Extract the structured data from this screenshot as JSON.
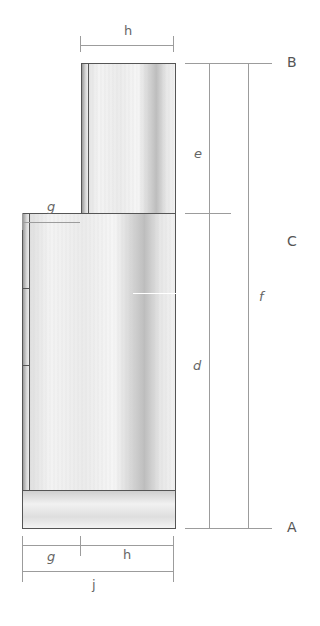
{
  "diagram": {
    "type": "cabinet elevation dimension drawing",
    "dimension_labels": {
      "top_width": "h",
      "upper_offset": "g",
      "upper_height": "e",
      "lower_height": "d",
      "total_height": "f",
      "bottom_offset": "g",
      "bottom_width": "h",
      "overall_width": "j"
    },
    "reference_points": {
      "top": "B",
      "middle": "C",
      "bottom": "A"
    },
    "colors": {
      "outline": "#555555",
      "dimension_line": "#9c9c9c",
      "label": "#666666",
      "panel_light": "#f3f3f3",
      "panel_shadow": "#bdbdbd"
    }
  }
}
